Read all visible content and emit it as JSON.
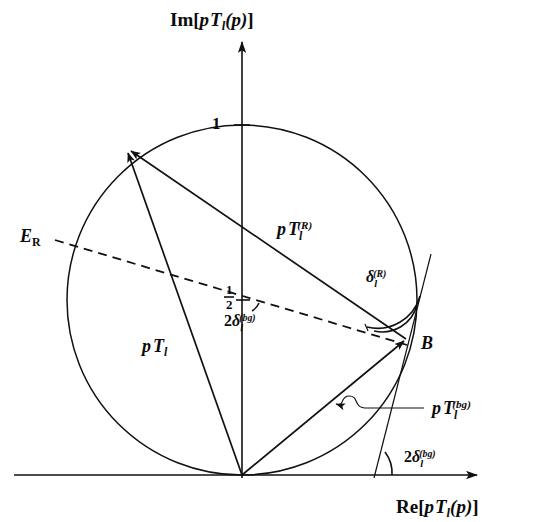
{
  "figure": {
    "type": "argand-diagram",
    "background_color": "#ffffff",
    "ink_color": "#111111",
    "axes": {
      "y_axis_label": "Im[pTₗ(p)]",
      "y_axis_label_parts": {
        "func": "Im",
        "open": "[",
        "p1": "p",
        "T": "T",
        "sub": "l",
        "arg": "(p)",
        "close": "]"
      },
      "x_axis_label": "Re[pTₗ(p)]",
      "x_axis_label_parts": {
        "func": "Re",
        "open": "[",
        "p1": "p",
        "T": "T",
        "sub": "l",
        "arg": "(p)",
        "close": "]"
      },
      "origin_x": 242,
      "origin_y": 475
    },
    "ticks": [
      {
        "name": "unit-tick",
        "label": "1",
        "axis": "imaginary",
        "value": 1,
        "x": 215,
        "y": 122
      },
      {
        "name": "half-tick",
        "label_numerator": "1",
        "label_denominator": "2",
        "axis": "imaginary",
        "value": 0.5,
        "x": 228,
        "y": 295
      }
    ],
    "circle": {
      "name": "unitarity-circle",
      "center_x": 242,
      "center_y": 300,
      "radius": 175,
      "description": "unitarity circle of radius 1/2 centered at i/2"
    },
    "points": [
      {
        "name": "point-b",
        "label": "B",
        "x": 408,
        "y": 338
      },
      {
        "name": "resonance-tip",
        "label": "",
        "x": 124,
        "y": 145
      },
      {
        "name": "origin",
        "label": "",
        "x": 242,
        "y": 475
      }
    ],
    "vectors": [
      {
        "name": "total-amplitude-vector",
        "label": "pTₗ",
        "label_parts": {
          "p": "p",
          "T": "T",
          "sub": "l",
          "sup": ""
        },
        "label_x": 152,
        "label_y": 352,
        "from": [
          242,
          475
        ],
        "to": [
          124,
          145
        ]
      },
      {
        "name": "resonance-amplitude-vector",
        "label": "pTₗ^(R)",
        "label_parts": {
          "p": "p",
          "T": "T",
          "sub": "l",
          "sup": "(R)"
        },
        "label_x": 278,
        "label_y": 232,
        "from": [
          408,
          338
        ],
        "to": [
          124,
          145
        ]
      },
      {
        "name": "background-amplitude-vector",
        "label": "pTₗ^(bg)",
        "label_parts": {
          "p": "p",
          "T": "T",
          "sub": "l",
          "sup": "(bg)"
        },
        "label_x": 443,
        "label_y": 411,
        "from": [
          242,
          475
        ],
        "to": [
          408,
          338
        ]
      }
    ],
    "angles": [
      {
        "name": "resonance-phase-angle",
        "label": "δₗ^(R)",
        "label_parts": {
          "sym": "δ",
          "sub": "l",
          "sup": "(R)"
        },
        "label_x": 372,
        "label_y": 275,
        "vertex": [
          408,
          338
        ]
      },
      {
        "name": "background-phase-angle-center",
        "label": "2δₗ^(bg)",
        "label_parts": {
          "coef": "2",
          "sym": "δ",
          "sub": "l",
          "sup": "(bg)"
        },
        "label_x": 228,
        "label_y": 321,
        "vertex": [
          242,
          300
        ]
      },
      {
        "name": "background-phase-angle-axis",
        "label": "2δₗ^(bg)",
        "label_parts": {
          "coef": "2",
          "sym": "δ",
          "sub": "l",
          "sup": "(bg)"
        },
        "label_x": 410,
        "label_y": 459,
        "vertex": [
          378,
          475
        ]
      }
    ],
    "annotations": [
      {
        "name": "resonance-energy-label",
        "label": "Eᵣ",
        "label_parts": {
          "sym": "E",
          "sub": "R"
        },
        "x": 22,
        "y": 236,
        "kind": "dashed-diameter-endpoint"
      }
    ],
    "dashed_line": {
      "name": "resonance-energy-diameter",
      "from": [
        55,
        240
      ],
      "to": [
        405,
        344
      ]
    },
    "tangent_line": {
      "name": "tangent-at-b",
      "from": [
        430,
        255
      ],
      "to": [
        375,
        478
      ]
    },
    "leader": {
      "name": "squiggle-leader",
      "description": "wavy leader line with left arrowhead pointing to background vector",
      "arrow_tip": [
        327,
        399
      ]
    }
  }
}
